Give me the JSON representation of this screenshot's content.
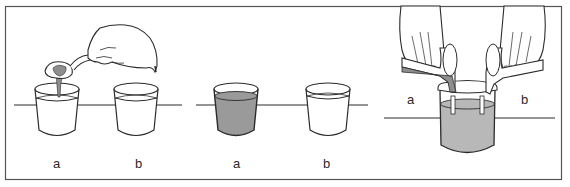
{
  "figure": {
    "colors": {
      "line": "#2b2b2b",
      "frame": "#555555",
      "liquid_dark": "#9a9a9a",
      "liquid_light": "#b8b8b8",
      "background": "#ffffff"
    },
    "panels": [
      {
        "id": "panel-1",
        "scene": "hand spooning dark substance into cup a",
        "labels": {
          "left": "a",
          "right": "b"
        }
      },
      {
        "id": "panel-2",
        "scene": "cup a filled with gray liquid, cup b clear",
        "labels": {
          "left": "a",
          "right": "b"
        }
      },
      {
        "id": "panel-3",
        "scene": "two hands pouring from a and b into one beaker",
        "labels": {
          "left": "a",
          "right": "b"
        }
      }
    ]
  }
}
